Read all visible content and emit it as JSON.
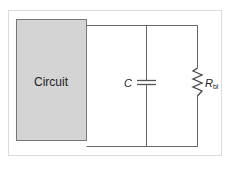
{
  "diagram": {
    "type": "circuit-schematic",
    "components": {
      "circuit_block": {
        "label": "Circuit",
        "fill": "#d4d4d4",
        "stroke": "#777777"
      },
      "capacitor": {
        "label": "C"
      },
      "resistor": {
        "label_main": "R",
        "label_sub": "bl"
      }
    },
    "wire_color": "#666666",
    "frame_color": "#dcdcdc"
  }
}
